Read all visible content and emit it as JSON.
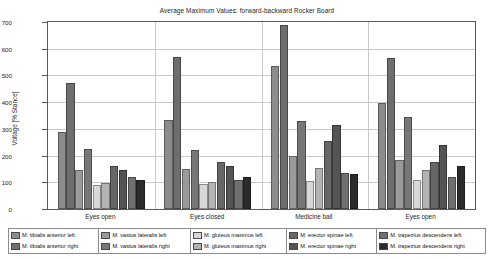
{
  "chart_data": {
    "type": "bar",
    "title": "Average Maximum Values: forward-backward Rocker Board",
    "xlabel": "",
    "ylabel": "Voltage [% Stance]",
    "ylim": [
      0,
      700
    ],
    "yticks": [
      0,
      100,
      200,
      300,
      400,
      500,
      600,
      700
    ],
    "grid": true,
    "legend_position": "bottom",
    "categories": [
      "Eyes open",
      "Eyes closed",
      "Medicine ball",
      "Eyes open"
    ],
    "series": [
      {
        "name": "M. tibialis anterior left",
        "color": "#8c8c8c",
        "values": [
          290,
          335,
          535,
          395
        ]
      },
      {
        "name": "M. tibialis anterior right",
        "color": "#6e6e6e",
        "values": [
          470,
          570,
          690,
          565
        ]
      },
      {
        "name": "M. vastus lateralis left",
        "color": "#9a9a9a",
        "values": [
          145,
          150,
          200,
          185
        ]
      },
      {
        "name": "M. vastus lateralis right",
        "color": "#777777",
        "values": [
          225,
          220,
          330,
          345
        ]
      },
      {
        "name": "M. gluteus maximus left",
        "color": "#d8d8d8",
        "values": [
          90,
          95,
          105,
          110
        ]
      },
      {
        "name": "M. gluteus maximus right",
        "color": "#b4b4b4",
        "values": [
          97,
          100,
          155,
          145
        ]
      },
      {
        "name": "M. erector spinae left",
        "color": "#676767",
        "values": [
          160,
          175,
          255,
          175
        ]
      },
      {
        "name": "M. erector spinae right",
        "color": "#545454",
        "values": [
          145,
          160,
          315,
          240
        ]
      },
      {
        "name": "M. trapezius descendens left",
        "color": "#707070",
        "values": [
          120,
          110,
          135,
          120
        ]
      },
      {
        "name": "M. trapezius descendens right",
        "color": "#2b2b2b",
        "values": [
          110,
          118,
          130,
          160
        ]
      }
    ]
  },
  "legend": {
    "columns": [
      [
        "M. tibialis anterior left",
        "M. tibialis anterior right"
      ],
      [
        "M. vastus lateralis left",
        "M. vastus lateralis right"
      ],
      [
        "M. gluteus maximus left",
        "M. gluteus maximus right"
      ],
      [
        "M. erector spinae left",
        "M. erector spinae right"
      ],
      [
        "M. trapezius descendens left",
        "M. trapezius descendens right"
      ]
    ]
  }
}
